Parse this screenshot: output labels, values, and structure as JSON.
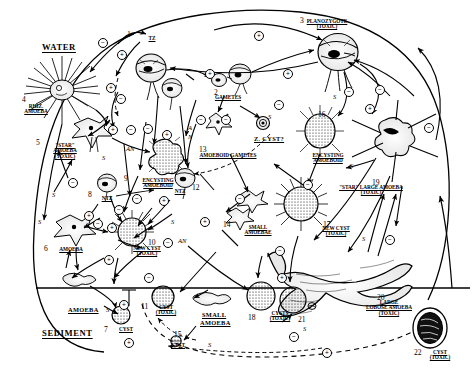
{
  "diagram": {
    "zones": [
      {
        "name": "water-zone-label",
        "label": "WATER",
        "x": 42,
        "y": 42
      },
      {
        "name": "sediment-zone-label",
        "label": "SEDIMENT",
        "x": 42,
        "y": 328
      }
    ],
    "stages": [
      {
        "n": "1",
        "name": "tz-flagellated-zoospore",
        "caption": [
          "TZ"
        ],
        "toxic": false,
        "num_x": 127,
        "num_y": 30,
        "cap_x": 141,
        "cap_y": 36,
        "cap_w": 22
      },
      {
        "n": "2",
        "name": "gametes",
        "caption": [
          "GAMETES"
        ],
        "toxic": false,
        "num_x": 214,
        "num_y": 88,
        "cap_x": 206,
        "cap_y": 95,
        "cap_w": 44
      },
      {
        "n": "3",
        "name": "planozygote-toxic",
        "caption": [
          "PLANOZYGOTE",
          "(TOXIC)"
        ],
        "toxic": true,
        "num_x": 300,
        "num_y": 16,
        "cap_x": 296,
        "cap_y": 19,
        "cap_w": 62
      },
      {
        "n": "4",
        "name": "rhizopodial-amoeba",
        "caption": [
          "RHIZ.",
          "AMOEBA"
        ],
        "toxic": false,
        "num_x": 22,
        "num_y": 95,
        "cap_x": 14,
        "cap_y": 104,
        "cap_w": 44
      },
      {
        "n": "5",
        "name": "star-amoeba-toxic",
        "caption": [
          "\"STAR\"",
          "AMOEBA",
          "(TOXIC)"
        ],
        "toxic": true,
        "num_x": 36,
        "num_y": 138,
        "cap_x": 44,
        "cap_y": 143,
        "cap_w": 42
      },
      {
        "n": "6",
        "name": "amoeba",
        "caption": [
          "AMOEBA"
        ],
        "toxic": false,
        "num_x": 44,
        "num_y": 244,
        "cap_x": 52,
        "cap_y": 247,
        "cap_w": 38
      },
      {
        "n": "7",
        "name": "cyst-sediment",
        "caption": [
          "CYST"
        ],
        "toxic": false,
        "num_x": 104,
        "num_y": 325,
        "cap_x": 113,
        "cap_y": 327,
        "cap_w": 26
      },
      {
        "n": "8",
        "name": "ntz-nontoxic-zoospore-left",
        "caption": [
          "NTZ"
        ],
        "toxic": false,
        "num_x": 88,
        "num_y": 190,
        "cap_x": 96,
        "cap_y": 196,
        "cap_w": 22
      },
      {
        "n": "9",
        "name": "encysting-amoeboid-left",
        "caption": [
          "ENCYSTING",
          "AMOEBOID"
        ],
        "toxic": false,
        "num_x": 124,
        "num_y": 174,
        "cap_x": 131,
        "cap_y": 178,
        "cap_w": 54
      },
      {
        "n": "10",
        "name": "new-cyst-toxic-left",
        "caption": [
          "NEW CYST",
          "(TOXIC)"
        ],
        "toxic": true,
        "num_x": 148,
        "num_y": 238,
        "cap_x": 119,
        "cap_y": 246,
        "cap_w": 56
      },
      {
        "n": "11",
        "name": "cyst-toxic-sediment",
        "caption": [
          "CYST",
          "(TOXIC)"
        ],
        "toxic": true,
        "num_x": 141,
        "num_y": 302,
        "cap_x": 150,
        "cap_y": 305,
        "cap_w": 32
      },
      {
        "n": "12",
        "name": "ntz-nontoxic-zoospore-mid",
        "caption": [
          "NTZ"
        ],
        "toxic": false,
        "num_x": 192,
        "num_y": 183,
        "cap_x": 168,
        "cap_y": 189,
        "cap_w": 24
      },
      {
        "n": "13",
        "name": "amoeboid-gametes",
        "caption": [
          "AMOEBOID GAMETES"
        ],
        "toxic": false,
        "num_x": 199,
        "num_y": 145,
        "cap_x": 190,
        "cap_y": 153,
        "cap_w": 76
      },
      {
        "n": "14",
        "name": "small-amoebae-water",
        "caption": [
          "SMALL",
          "AMOEBAE"
        ],
        "toxic": false,
        "num_x": 223,
        "num_y": 220,
        "cap_x": 238,
        "cap_y": 225,
        "cap_w": 40
      },
      {
        "n": "15",
        "name": "cyst-sediment-small",
        "caption": [
          "CYST"
        ],
        "toxic": false,
        "num_x": 174,
        "num_y": 330,
        "cap_x": 165,
        "cap_y": 343,
        "cap_w": 26
      },
      {
        "n": "16",
        "name": "encysting-amoeboid-right",
        "caption": [
          "ENCYSTING",
          "AMOEBOID"
        ],
        "toxic": false,
        "num_x": 318,
        "num_y": 110,
        "cap_x": 300,
        "cap_y": 153,
        "cap_w": 56
      },
      {
        "n": "17",
        "name": "new-cyst-toxic-right",
        "caption": [
          "NEW CYST",
          "(TOXIC)"
        ],
        "toxic": true,
        "num_x": 323,
        "num_y": 220,
        "cap_x": 308,
        "cap_y": 226,
        "cap_w": 56
      },
      {
        "n": "18",
        "name": "cysts-toxic-sediment",
        "caption": [
          "CYSTS",
          "(TOXIC)"
        ],
        "toxic": true,
        "num_x": 248,
        "num_y": 313,
        "cap_x": 262,
        "cap_y": 311,
        "cap_w": 36
      },
      {
        "n": "19",
        "name": "star-large-amoeba-toxic",
        "caption": [
          "\"STAR\" LARGE AMOEBA",
          "(TOXIC)"
        ],
        "toxic": true,
        "num_x": 372,
        "num_y": 178,
        "cap_x": 324,
        "cap_y": 185,
        "cap_w": 94
      },
      {
        "n": "20",
        "name": "large-lobose-amoeba-toxic",
        "caption": [
          "LARGE",
          "LOBOSE AMOEBA",
          "(TOXIC)"
        ],
        "toxic": true,
        "num_x": 377,
        "num_y": 293,
        "cap_x": 350,
        "cap_y": 300,
        "cap_w": 78
      },
      {
        "n": "21",
        "name": "cyst-sediment-right",
        "caption": [],
        "toxic": false,
        "num_x": 298,
        "num_y": 315,
        "cap_x": 0,
        "cap_y": 0,
        "cap_w": 0
      },
      {
        "n": "22",
        "name": "cyst-toxic-encapsulated",
        "caption": [
          "CYST",
          "(TOXIC)"
        ],
        "toxic": true,
        "num_x": 414,
        "num_y": 348,
        "cap_x": 424,
        "cap_y": 350,
        "cap_w": 32
      }
    ],
    "inline_labels": [
      {
        "name": "z-cyst-label",
        "text": "Z. CYST?",
        "x": 254,
        "y": 135
      },
      {
        "name": "amoeba-sediment-label",
        "text": "AMOEBA",
        "x": 68,
        "y": 306
      },
      {
        "name": "small-amoeba-sed-label",
        "text": "SMALL",
        "x": 202,
        "y": 311
      },
      {
        "name": "small-amoeba-sed-label2",
        "text": "AMOEBA",
        "x": 200,
        "y": 319
      }
    ],
    "pathway_tags": [
      {
        "name": "tag-s-1",
        "text": "S",
        "x": 102,
        "y": 154
      },
      {
        "name": "tag-s-2",
        "text": "S",
        "x": 52,
        "y": 191
      },
      {
        "name": "tag-s-3",
        "text": "S",
        "x": 38,
        "y": 218
      },
      {
        "name": "tag-s-4",
        "text": "S",
        "x": 171,
        "y": 218
      },
      {
        "name": "tag-s-5",
        "text": "S",
        "x": 268,
        "y": 113
      },
      {
        "name": "tag-s-6",
        "text": "S",
        "x": 333,
        "y": 93
      },
      {
        "name": "tag-s-7",
        "text": "S",
        "x": 350,
        "y": 162
      },
      {
        "name": "tag-s-8",
        "text": "S",
        "x": 362,
        "y": 235
      },
      {
        "name": "tag-s-9",
        "text": "S",
        "x": 106,
        "y": 306
      },
      {
        "name": "tag-s-10",
        "text": "S",
        "x": 208,
        "y": 341
      },
      {
        "name": "tag-s-11",
        "text": "S",
        "x": 303,
        "y": 325
      },
      {
        "name": "tag-an-1",
        "text": "AN",
        "x": 126,
        "y": 145
      },
      {
        "name": "tag-a-2",
        "text": "A",
        "x": 188,
        "y": 124
      },
      {
        "name": "tag-n-2",
        "text": "N",
        "x": 188,
        "y": 133
      },
      {
        "name": "tag-an-3",
        "text": "AN",
        "x": 178,
        "y": 237
      }
    ],
    "sign_markers": [
      {
        "name": "minus-sign",
        "sign": "−",
        "x": 98,
        "y": 38
      },
      {
        "name": "plus-sign",
        "sign": "+",
        "x": 117,
        "y": 50
      },
      {
        "name": "plus-sign",
        "sign": "+",
        "x": 106,
        "y": 83
      },
      {
        "name": "minus-sign",
        "sign": "−",
        "x": 116,
        "y": 94
      },
      {
        "name": "plus-sign",
        "sign": "+",
        "x": 108,
        "y": 125
      },
      {
        "name": "minus-sign",
        "sign": "−",
        "x": 126,
        "y": 125
      },
      {
        "name": "minus-sign",
        "sign": "−",
        "x": 143,
        "y": 124
      },
      {
        "name": "plus-sign",
        "sign": "+",
        "x": 162,
        "y": 130
      },
      {
        "name": "plus-sign",
        "sign": "+",
        "x": 205,
        "y": 69
      },
      {
        "name": "plus-sign",
        "sign": "+",
        "x": 254,
        "y": 31
      },
      {
        "name": "plus-sign",
        "sign": "+",
        "x": 283,
        "y": 69
      },
      {
        "name": "minus-sign",
        "sign": "−",
        "x": 196,
        "y": 115
      },
      {
        "name": "minus-sign",
        "sign": "−",
        "x": 221,
        "y": 115
      },
      {
        "name": "minus-sign",
        "sign": "−",
        "x": 274,
        "y": 100
      },
      {
        "name": "minus-sign",
        "sign": "−",
        "x": 344,
        "y": 87
      },
      {
        "name": "minus-sign",
        "sign": "−",
        "x": 375,
        "y": 85
      },
      {
        "name": "plus-sign",
        "sign": "+",
        "x": 365,
        "y": 104
      },
      {
        "name": "minus-sign",
        "sign": "−",
        "x": 424,
        "y": 123
      },
      {
        "name": "minus-sign",
        "sign": "−",
        "x": 68,
        "y": 178
      },
      {
        "name": "minus-sign",
        "sign": "−",
        "x": 132,
        "y": 194
      },
      {
        "name": "plus-sign",
        "sign": "+",
        "x": 159,
        "y": 196
      },
      {
        "name": "plus-sign",
        "sign": "+",
        "x": 84,
        "y": 211
      },
      {
        "name": "minus-sign",
        "sign": "−",
        "x": 93,
        "y": 219
      },
      {
        "name": "minus-sign",
        "sign": "−",
        "x": 114,
        "y": 205
      },
      {
        "name": "plus-sign",
        "sign": "+",
        "x": 107,
        "y": 223
      },
      {
        "name": "minus-sign",
        "sign": "−",
        "x": 163,
        "y": 238
      },
      {
        "name": "plus-sign",
        "sign": "+",
        "x": 104,
        "y": 255
      },
      {
        "name": "plus-sign",
        "sign": "+",
        "x": 200,
        "y": 217
      },
      {
        "name": "minus-sign",
        "sign": "−",
        "x": 235,
        "y": 194
      },
      {
        "name": "minus-sign",
        "sign": "−",
        "x": 303,
        "y": 180
      },
      {
        "name": "minus-sign",
        "sign": "−",
        "x": 275,
        "y": 246
      },
      {
        "name": "minus-sign",
        "sign": "−",
        "x": 385,
        "y": 235
      },
      {
        "name": "minus-sign",
        "sign": "−",
        "x": 144,
        "y": 273
      },
      {
        "name": "plus-sign",
        "sign": "+",
        "x": 277,
        "y": 273
      },
      {
        "name": "plus-sign",
        "sign": "+",
        "x": 119,
        "y": 300
      },
      {
        "name": "plus-sign",
        "sign": "+",
        "x": 124,
        "y": 338
      },
      {
        "name": "plus-sign",
        "sign": "+",
        "x": 322,
        "y": 348
      },
      {
        "name": "minus-sign",
        "sign": "−",
        "x": 289,
        "y": 332
      }
    ]
  }
}
